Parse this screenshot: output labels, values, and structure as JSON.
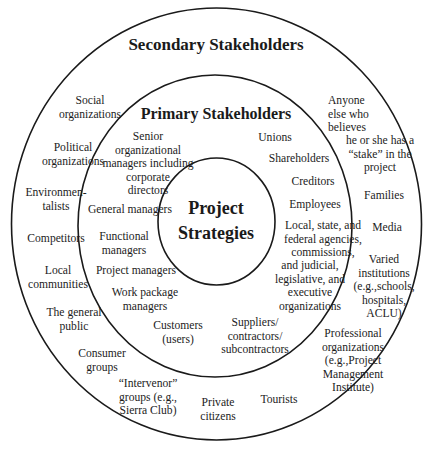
{
  "diagram": {
    "rings": {
      "outer": {
        "label": "Secondary Stakeholders"
      },
      "middle": {
        "label": "Primary Stakeholders"
      },
      "inner": {
        "label": "Project\nStrategies"
      }
    },
    "secondary_stakeholders": [
      "Social\norganizations",
      "Political\norganizations",
      "Environmen-\ntalists",
      "Competitors",
      "Local\ncommunities",
      "The general\npublic",
      "Consumer\ngroups",
      "“Intervenor”\ngroups (e.g.,\nSierra Club)",
      "Private\ncitizens",
      "Tourists",
      "Professional\norganizations\n(e.g.,Project\nManagement\nInstitute)",
      "Varied\ninstitutions\n(e.g.,schools,\nhospitals,\nACLU)",
      "Media",
      "Families",
      "Anyone\nelse who\nbelieves",
      "he or she has a\n“stake” in the\nproject"
    ],
    "primary_stakeholders": [
      "Senior\norganizational\nmanagers including\ncorporate\ndirectors",
      "General managers",
      "Functional\nmanagers",
      "Project managers",
      "Work package\nmanagers",
      "Customers\n(users)",
      "Suppliers/\ncontractors/\nsubcontractors",
      "Unions",
      "Shareholders",
      "Creditors",
      "Employees",
      "Local, state, and\nfederal agencies,\ncommissions,",
      "and judicial,\nlegislative, and\nexecutive\norganizations"
    ]
  }
}
